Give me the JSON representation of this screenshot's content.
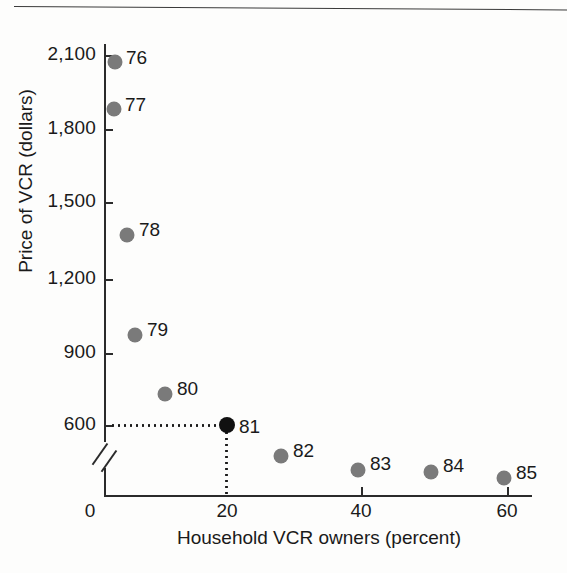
{
  "chart_data": {
    "type": "scatter",
    "title": "",
    "xlabel": "Household VCR owners (percent)",
    "ylabel": "Price of VCR (dollars)",
    "xlim": [
      0,
      65
    ],
    "ylim": [
      300,
      2250
    ],
    "x_ticks": [
      "0",
      "20",
      "40",
      "60"
    ],
    "x_tick_values": [
      0,
      20,
      40,
      60
    ],
    "y_ticks": [
      "600",
      "900",
      "1,200",
      "1,500",
      "1,800",
      "2,100"
    ],
    "y_tick_values": [
      600,
      900,
      1200,
      1500,
      1800,
      2100
    ],
    "y_axis_break": true,
    "grid": false,
    "legend": "none",
    "point_labels": [
      "76",
      "77",
      "78",
      "79",
      "80",
      "81",
      "82",
      "83",
      "84",
      "85"
    ],
    "x": [
      2,
      2,
      4.5,
      6,
      11,
      20,
      29,
      42,
      54,
      66
    ],
    "y": [
      2075,
      1860,
      1370,
      965,
      725,
      600,
      480,
      425,
      415,
      390
    ],
    "points": [
      {
        "label": "76",
        "x": 2,
        "y": 2075,
        "highlight": false,
        "px": 115,
        "py": 62,
        "lx": 126,
        "ly": 58
      },
      {
        "label": "77",
        "x": 2,
        "y": 1860,
        "highlight": false,
        "px": 114,
        "py": 109,
        "lx": 125,
        "ly": 105
      },
      {
        "label": "78",
        "x": 4.5,
        "y": 1370,
        "highlight": false,
        "px": 127,
        "py": 235,
        "lx": 139,
        "ly": 230
      },
      {
        "label": "79",
        "x": 6,
        "y": 965,
        "highlight": false,
        "px": 135,
        "py": 335,
        "lx": 147,
        "ly": 330
      },
      {
        "label": "80",
        "x": 11,
        "y": 725,
        "highlight": false,
        "px": 165,
        "py": 394,
        "lx": 177,
        "ly": 389
      },
      {
        "label": "81",
        "x": 20,
        "y": 600,
        "highlight": true,
        "px": 227,
        "py": 425,
        "lx": 239,
        "ly": 427
      },
      {
        "label": "82",
        "x": 29,
        "y": 480,
        "highlight": false,
        "px": 281,
        "py": 456,
        "lx": 293,
        "ly": 451
      },
      {
        "label": "83",
        "x": 42,
        "y": 425,
        "highlight": false,
        "px": 358,
        "py": 470,
        "lx": 370,
        "ly": 464
      },
      {
        "label": "84",
        "x": 54,
        "y": 415,
        "highlight": false,
        "px": 431,
        "py": 472,
        "lx": 443,
        "ly": 466
      },
      {
        "label": "85",
        "x": 66,
        "y": 390,
        "highlight": false,
        "px": 504,
        "py": 478,
        "lx": 516,
        "ly": 473
      }
    ],
    "annotations": {
      "guide_to_point": "81",
      "guide_x_value": 20,
      "guide_y_value": 600
    },
    "colors": {
      "point": "#7a7a7a",
      "point_highlight": "#111111",
      "axis": "#2b2b2b",
      "text": "#1a1a1a",
      "background": "#fdfdfc"
    }
  },
  "y_tick_positions": [
    {
      "label": "2,100",
      "top": 55
    },
    {
      "label": "1,800",
      "top": 129
    },
    {
      "label": "1,500",
      "top": 202
    },
    {
      "label": "1,200",
      "top": 279
    },
    {
      "label": "900",
      "top": 353
    },
    {
      "label": "600",
      "top": 425
    }
  ],
  "x_tick_positions": [
    {
      "label": "0",
      "left": 90,
      "tick": false
    },
    {
      "label": "20",
      "left": 227,
      "tick": false
    },
    {
      "label": "40",
      "left": 361,
      "tick": true
    },
    {
      "label": "60",
      "left": 507,
      "tick": true
    }
  ]
}
